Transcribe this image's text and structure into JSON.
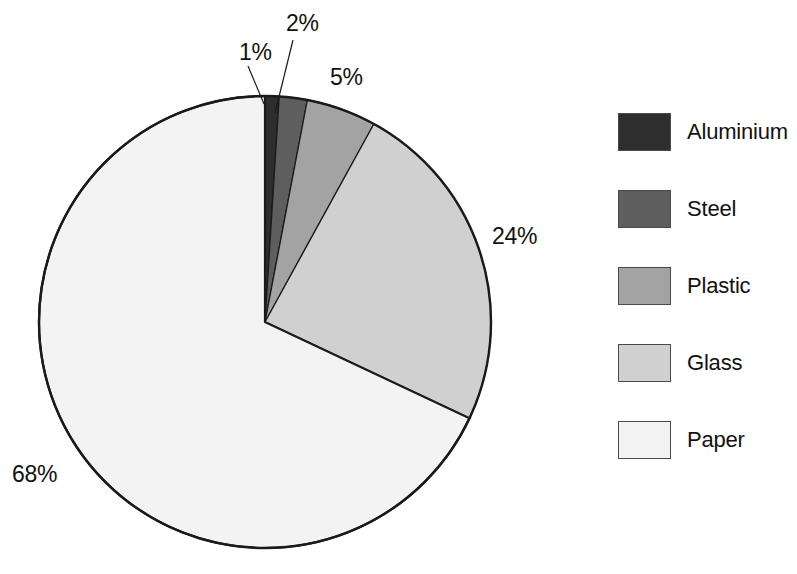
{
  "chart_data": {
    "type": "pie",
    "title": "",
    "labels": [
      "Aluminium",
      "Steel",
      "Plastic",
      "Glass",
      "Paper"
    ],
    "values": [
      1,
      2,
      5,
      24,
      68
    ],
    "value_labels": [
      "1%",
      "2%",
      "5%",
      "24%",
      "68%"
    ],
    "unit": "%",
    "total": 100,
    "colors": [
      "#2e2e2e",
      "#5e5e5e",
      "#a3a3a3",
      "#d0d0d0",
      "#f3f3f3"
    ],
    "start_angle_deg": 0,
    "direction": "clockwise",
    "legend_position": "right",
    "grid": false,
    "xlabel": "",
    "ylabel": "",
    "slices": [
      {
        "label": "Aluminium",
        "value": 1,
        "value_label": "1%",
        "color": "#2e2e2e"
      },
      {
        "label": "Steel",
        "value": 2,
        "value_label": "2%",
        "color": "#5e5e5e"
      },
      {
        "label": "Plastic",
        "value": 5,
        "value_label": "5%",
        "color": "#a3a3a3"
      },
      {
        "label": "Glass",
        "value": 24,
        "value_label": "24%",
        "color": "#d0d0d0"
      },
      {
        "label": "Paper",
        "value": 68,
        "value_label": "68%",
        "color": "#f3f3f3"
      }
    ]
  },
  "legend": {
    "items": [
      {
        "label": "Aluminium",
        "color": "#2e2e2e"
      },
      {
        "label": "Steel",
        "color": "#5e5e5e"
      },
      {
        "label": "Plastic",
        "color": "#a3a3a3"
      },
      {
        "label": "Glass",
        "color": "#d0d0d0"
      },
      {
        "label": "Paper",
        "color": "#f3f3f3"
      }
    ]
  }
}
